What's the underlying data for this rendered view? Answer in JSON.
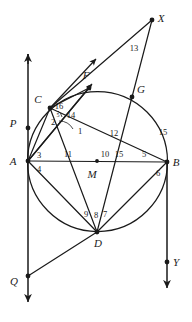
{
  "figure": {
    "type": "geometry-diagram",
    "stroke_color": "#1a1a1a",
    "background_color": "#ffffff",
    "circle": {
      "cx": 97.5,
      "cy": 161.5,
      "r": 70
    },
    "points": [
      {
        "id": "A",
        "label": "A",
        "x": 28,
        "y": 161,
        "label_x": 13,
        "label_y": 165,
        "dot": true
      },
      {
        "id": "B",
        "label": "B",
        "x": 167,
        "y": 162,
        "label_x": 176,
        "label_y": 166,
        "dot": true
      },
      {
        "id": "C",
        "label": "C",
        "x": 50,
        "y": 108,
        "label_x": 38,
        "label_y": 103,
        "dot": true
      },
      {
        "id": "D",
        "label": "D",
        "x": 97,
        "y": 232,
        "label_x": 98,
        "label_y": 247,
        "dot": true
      },
      {
        "id": "F",
        "label": "F",
        "x": 89,
        "y": 88,
        "label_x": 86,
        "label_y": 79,
        "dot": true
      },
      {
        "id": "G",
        "label": "G",
        "x": 132,
        "y": 97,
        "label_x": 141,
        "label_y": 93,
        "dot": true
      },
      {
        "id": "M",
        "label": "M",
        "x": 97,
        "y": 161,
        "label_x": 92,
        "label_y": 178,
        "dot": true
      },
      {
        "id": "X",
        "label": "X",
        "x": 152,
        "y": 20,
        "label_x": 161,
        "label_y": 22,
        "dot": true
      },
      {
        "id": "P",
        "label": "P",
        "x": 28,
        "y": 128,
        "label_x": 13,
        "label_y": 127,
        "dot": true
      },
      {
        "id": "Q",
        "label": "Q",
        "x": 28,
        "y": 276,
        "label_x": 14,
        "label_y": 285,
        "dot": true
      },
      {
        "id": "Y",
        "label": "Y",
        "x": 167,
        "y": 262,
        "label_x": 176,
        "label_y": 266,
        "dot": true
      }
    ],
    "angle_labels": [
      {
        "n": "1",
        "x": 80,
        "y": 134,
        "size": "normal"
      },
      {
        "n": "2",
        "x": 53,
        "y": 125,
        "size": "normal"
      },
      {
        "n": "3",
        "x": 39,
        "y": 158,
        "size": "normal"
      },
      {
        "n": "4",
        "x": 39,
        "y": 172,
        "size": "normal"
      },
      {
        "n": "5",
        "x": 144,
        "y": 157,
        "size": "normal"
      },
      {
        "n": "6",
        "x": 158,
        "y": 176,
        "size": "normal"
      },
      {
        "n": "7",
        "x": 105,
        "y": 217,
        "size": "normal"
      },
      {
        "n": "8",
        "x": 96,
        "y": 218,
        "size": "normal"
      },
      {
        "n": "9",
        "x": 86,
        "y": 217,
        "size": "normal"
      },
      {
        "n": "10",
        "x": 105,
        "y": 157,
        "size": "normal"
      },
      {
        "n": "11",
        "x": 68,
        "y": 157,
        "size": "normal"
      },
      {
        "n": "12",
        "x": 114,
        "y": 136,
        "size": "normal"
      },
      {
        "n": "13",
        "x": 134,
        "y": 51,
        "size": "normal"
      },
      {
        "n": "14",
        "x": 71,
        "y": 118,
        "size": "normal"
      },
      {
        "n": "15",
        "x": 119,
        "y": 157,
        "size": "normal"
      },
      {
        "n": "15",
        "x": 163,
        "y": 135,
        "size": "normal"
      },
      {
        "n": "16",
        "x": 59,
        "y": 109,
        "size": "normal"
      },
      {
        "n": "5",
        "x": 58,
        "y": 117,
        "size": "small"
      }
    ],
    "segments": [
      {
        "name": "A-B-diameter",
        "x1": 28,
        "y1": 161,
        "x2": 167,
        "y2": 162
      },
      {
        "name": "A-C",
        "x1": 28,
        "y1": 161,
        "x2": 50,
        "y2": 108
      },
      {
        "name": "A-F",
        "x1": 28,
        "y1": 161,
        "x2": 89,
        "y2": 88
      },
      {
        "name": "A-D",
        "x1": 28,
        "y1": 161,
        "x2": 97,
        "y2": 232
      },
      {
        "name": "C-B",
        "x1": 50,
        "y1": 108,
        "x2": 167,
        "y2": 162
      },
      {
        "name": "C-D",
        "x1": 50,
        "y1": 108,
        "x2": 97,
        "y2": 232
      },
      {
        "name": "C-F",
        "x1": 50,
        "y1": 108,
        "x2": 89,
        "y2": 88
      },
      {
        "name": "C-X",
        "x1": 50,
        "y1": 108,
        "x2": 152,
        "y2": 20
      },
      {
        "name": "D-B",
        "x1": 97,
        "y1": 232,
        "x2": 167,
        "y2": 162
      },
      {
        "name": "D-G-X",
        "x1": 97,
        "y1": 232,
        "x2": 152,
        "y2": 20
      },
      {
        "name": "D-Q",
        "x1": 97,
        "y1": 232,
        "x2": 28,
        "y2": 276
      }
    ],
    "rays": [
      {
        "name": "ray-through-C-F-upper",
        "x1": 50,
        "y1": 108,
        "x2": 96,
        "y2": 59
      },
      {
        "name": "ray-A-F-upper",
        "x1": 28,
        "y1": 161,
        "x2": 92,
        "y2": 84
      }
    ],
    "vertical_lines": [
      {
        "name": "line-through-A-P-Q",
        "x": 28,
        "y_top": 54,
        "y_bottom": 302,
        "arrow_top": true,
        "arrow_bottom": true
      },
      {
        "name": "line-through-B-Y",
        "x": 167,
        "y_top": 162,
        "y_bottom": 288,
        "arrow_top": false,
        "arrow_bottom": true
      }
    ]
  }
}
